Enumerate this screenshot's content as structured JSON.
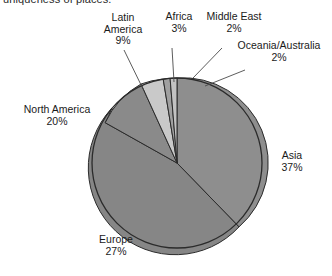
{
  "caption": {
    "text": "uniqueness of places."
  },
  "chart_data": {
    "type": "pie",
    "title": "",
    "categories": [
      "Asia",
      "Europe",
      "North America",
      "Latin America",
      "Africa",
      "Middle East",
      "Oceania/Australia"
    ],
    "values": [
      37,
      27,
      20,
      9,
      3,
      2,
      2
    ],
    "value_suffix": "%",
    "legend": "none",
    "labels_position": "outside-with-leader-lines",
    "slices": [
      {
        "name": "Asia",
        "percent": "37%",
        "value": 37,
        "color": "#8e8e8e"
      },
      {
        "name": "Europe",
        "percent": "27%",
        "value": 27,
        "color": "#868686"
      },
      {
        "name": "North America",
        "percent": "20%",
        "value": 20,
        "color": "#a9a9a9"
      },
      {
        "name": "Latin America",
        "percent": "9%",
        "value": 9,
        "color": "#8a8a8a"
      },
      {
        "name": "Africa",
        "percent": "3%",
        "value": 3,
        "color": "#c9c9c9"
      },
      {
        "name": "Middle East",
        "percent": "2%",
        "value": 2,
        "color": "#a0a0a0"
      },
      {
        "name": "Oceania/Australia",
        "percent": "2%",
        "value": 2,
        "color": "#c2c2c2"
      }
    ],
    "colors": {
      "outline": "#2b2b2b",
      "leader_line": "#4a4a4a",
      "background": "#ffffff"
    },
    "geometry": {
      "center_x": 177,
      "center_y": 163,
      "radius": 85,
      "start_angle_deg": -90,
      "direction": "clockwise"
    }
  }
}
